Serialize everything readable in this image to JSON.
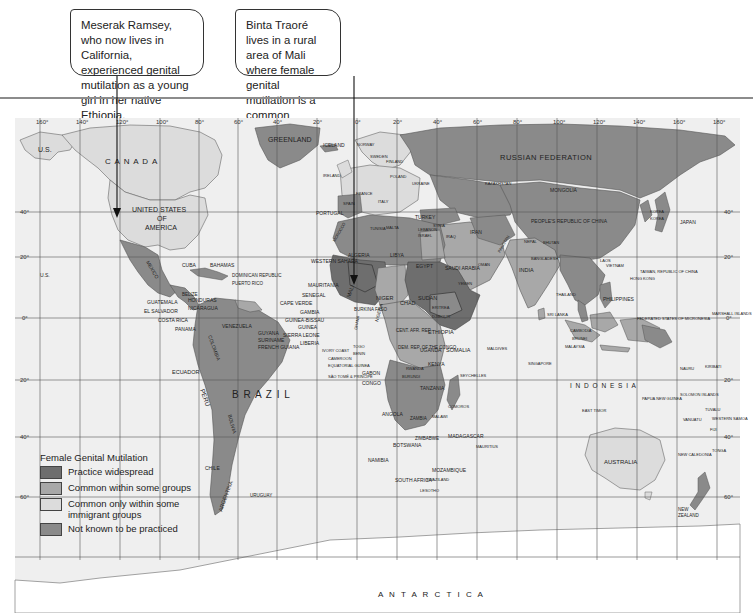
{
  "callouts": [
    {
      "text": "Meserak Ramsey, who now lives in California, experienced genital mutilation as a young girl in her native Ethiopia.",
      "points_to": "California"
    },
    {
      "text": "Binta Traoré lives in a rural area of Mali where female genital mutilation is a common practice.",
      "points_to": "Mali"
    }
  ],
  "legend": {
    "title": "Female Genital Mutilation",
    "items": [
      {
        "label": "Practice widespread",
        "color": "#6e6e6e"
      },
      {
        "label": "Common within some groups",
        "color": "#a8a8a8"
      },
      {
        "label": "Common only within some immigrant groups",
        "color": "#dcdcdc"
      },
      {
        "label": "Not known to be practiced",
        "color": "#8a8a8a"
      }
    ]
  },
  "colors": {
    "ocean": "#efefef",
    "widespread": "#6e6e6e",
    "some_groups": "#a8a8a8",
    "immigrant": "#dcdcdc",
    "not_known": "#8a8a8a",
    "grid": "#555555"
  },
  "graticule": {
    "longitude_labels": [
      "160°",
      "140°",
      "120°",
      "100°",
      "80°",
      "60°",
      "40°",
      "20°",
      "0°",
      "20°",
      "40°",
      "60°",
      "80°",
      "100°",
      "120°",
      "140°",
      "160°",
      "180°"
    ],
    "latitude_labels": [
      "40°",
      "20°",
      "0°",
      "20°",
      "40°",
      "60°"
    ]
  },
  "labels": {
    "us": "U.S.",
    "us_hawaii": "U.S.",
    "canada": "C A N A D A",
    "greenland": "GREENLAND",
    "iceland": "ICELAND",
    "russia": "RUSSIAN  FEDERATION",
    "usa_1": "UNITED STATES",
    "usa_2": "OF",
    "usa_3": "AMERICA",
    "mexico": "MEXICO",
    "cuba": "CUBA",
    "bahamas": "BAHAMAS",
    "dominican": "DOMINICAN REPUBLIC",
    "puerto_rico": "PUERTO RICO",
    "guatemala": "GUATEMALA",
    "el_salvador": "EL SALVADOR",
    "honduras": "HONDURAS",
    "nicaragua": "NICARAGUA",
    "costa_rica": "COSTA RICA",
    "panama": "PANAMA",
    "belize": "BELIZE",
    "jamaica": "JAMAICA",
    "venezuela": "VENEZUELA",
    "guyana": "GUYANA",
    "suriname": "SURINAME",
    "french_guiana": "FRENCH GUIANA",
    "colombia": "COLOMBIA",
    "ecuador": "ECUADOR",
    "peru": "PERU",
    "brazil": "B R A Z I L",
    "bolivia": "BOLIVIA",
    "chile": "CHILE",
    "argentina": "ARGENTINA",
    "uruguay": "URUGUAY",
    "portugal": "PORTUGAL",
    "ireland": "IRELAND",
    "western_sahara": "WESTERN SAHARA",
    "mauritania": "MAURITANIA",
    "senegal": "SENEGAL",
    "cape_verde": "CAPE VERDE",
    "gambia": "GAMBIA",
    "guinea_bissau": "GUINEA-BISSAU",
    "guinea": "GUINEA",
    "sierra_leone": "SIERRA LEONE",
    "liberia": "LIBERIA",
    "ivory_coast": "IVORY COAST",
    "mali": "MALI",
    "burkina": "BURKINA FASO",
    "niger": "NIGER",
    "nigeria": "NIGERIA",
    "chad": "CHAD",
    "sudan": "SUDAN",
    "eritrea": "ERITREA",
    "djibouti": "DJIBOUTI",
    "ethiopia": "ETHIOPIA",
    "somalia": "SOMALIA",
    "car": "CENT. AFR. REP.",
    "drc": "DEM. REP. OF THE CONGO",
    "uganda": "UGANDA",
    "kenya": "KENYA",
    "rwanda": "RWANDA",
    "burundi": "BURUNDI",
    "tanzania": "TANZANIA",
    "gabon": "GABON",
    "congo": "CONGO",
    "cameroon": "CAMEROON",
    "eq_guinea": "EQUATORIAL GUINEA",
    "sao_tome": "SÃO TOMÉ & PRÍNCIPE",
    "togo": "TOGO",
    "benin": "BENIN",
    "ghana": "GHANA",
    "angola": "ANGOLA",
    "zambia": "ZAMBIA",
    "malawi": "MALAWI",
    "zimbabwe": "ZIMBABWE",
    "botswana": "BOTSWANA",
    "namibia": "NAMIBIA",
    "mozambique": "MOZAMBIQUE",
    "madagascar": "MADAGASCAR",
    "mauritius": "MAURITIUS",
    "comoros": "COMOROS",
    "swaziland": "SWAZILAND",
    "lesotho": "LESOTHO",
    "south_africa": "SOUTH AFRICA",
    "seychelles": "SEYCHELLES",
    "maldives": "MALDIVES",
    "algeria": "ALGERIA",
    "libya": "LIBYA",
    "egypt": "EGYPT",
    "tunisia": "TUNISIA",
    "morocco": "MOROCCO",
    "turkey": "TURKEY",
    "iran": "IRAN",
    "iraq": "IRAQ",
    "saudi": "SAUDI ARABIA",
    "yemen": "YEMEN",
    "oman": "OMAN",
    "india": "INDIA",
    "pakistan": "PAKISTAN",
    "sri_lanka": "SRI LANKA",
    "bangladesh": "BANGLADESH",
    "nepal": "NEPAL",
    "bhutan": "BHUTAN",
    "china": "PEOPLE'S REPUBLIC OF CHINA",
    "mongolia": "MONGOLIA",
    "kazakhstan": "KAZAKHSTAN",
    "korea_n": "KOREA",
    "korea_s": "KOREA",
    "japan": "JAPAN",
    "taiwan": "TAIWAN, REPUBLIC OF CHINA",
    "hong_kong": "HONG KONG",
    "philippines": "PHILIPPINES",
    "thailand": "THAILAND",
    "vietnam": "VIETNAM",
    "laos": "LAOS",
    "cambodia": "CAMBODIA",
    "malaysia": "MALAYSIA",
    "brunei": "BRUNEI",
    "singapore": "SINGAPORE",
    "indonesia": "I N D O N E S I A",
    "png": "PAPUA NEW GUINEA",
    "east_timor": "EAST TIMOR",
    "micronesia": "FEDERATED STATES OF MICRONESIA",
    "marshall": "MARSHALL ISLANDS",
    "nauru": "NAURU",
    "kiribati": "KIRIBATI",
    "solomon": "SOLOMON ISLANDS",
    "tuvalu": "TUVALU",
    "vanuatu": "VANUATU",
    "samoa": "WESTERN SAMOA",
    "fiji": "FIJI",
    "tonga": "TONGA",
    "new_caledonia": "NEW CALEDONIA",
    "australia": "AUSTRALIA",
    "new_zealand_1": "NEW",
    "new_zealand_2": "ZEALAND",
    "antarctica": "A N T A R C T I C A",
    "norway": "NORWAY",
    "finland": "FINLAND",
    "sweden": "SWEDEN",
    "poland": "POLAND",
    "ukraine": "UKRAINE",
    "france": "FRANCE",
    "spain": "SPAIN",
    "malta": "MALTA",
    "italy": "ITALY",
    "syria": "SYRIA",
    "lebanon": "LEBANON",
    "israel": "ISRAEL"
  }
}
